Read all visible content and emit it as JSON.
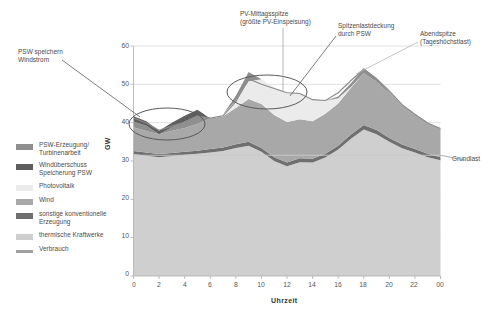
{
  "chart_data": {
    "type": "area",
    "title": "",
    "xlabel": "Uhrzeit",
    "ylabel": "GW",
    "ylim": [
      0,
      60
    ],
    "ytick_labels": [
      "0",
      "10",
      "20",
      "30",
      "40",
      "50",
      "60"
    ],
    "ytick_values": [
      0,
      10,
      20,
      30,
      40,
      50,
      60
    ],
    "xtick_labels": [
      "0",
      "2",
      "4",
      "6",
      "8",
      "10",
      "12",
      "14",
      "16",
      "18",
      "20",
      "22",
      "00"
    ],
    "xtick_values": [
      0,
      2,
      4,
      6,
      8,
      10,
      12,
      14,
      16,
      18,
      20,
      22,
      24
    ],
    "grid": true,
    "legend_position": "left-outside",
    "x": [
      0,
      1,
      2,
      3,
      4,
      5,
      6,
      7,
      8,
      9,
      10,
      11,
      12,
      13,
      14,
      15,
      16,
      17,
      18,
      19,
      20,
      21,
      22,
      23,
      24
    ],
    "series": [
      {
        "name": "thermische Kraftwerke",
        "color": "#cfcfcf",
        "values": [
          31.8,
          31.4,
          31.0,
          31.3,
          31.6,
          31.9,
          32.2,
          32.6,
          33.4,
          34.0,
          32.4,
          30.0,
          28.6,
          29.7,
          29.6,
          30.9,
          33.0,
          35.8,
          38.2,
          37.0,
          35.0,
          33.3,
          32.2,
          31.0,
          30.2
        ]
      },
      {
        "name": "sonstige konventionelle Erzeugung",
        "color": "#6f6f6f",
        "values": [
          0.8,
          0.8,
          0.8,
          0.8,
          0.8,
          0.8,
          0.9,
          0.9,
          1.0,
          1.0,
          1.0,
          1.0,
          1.0,
          1.0,
          1.0,
          1.0,
          1.0,
          1.1,
          1.2,
          1.1,
          1.0,
          1.0,
          0.9,
          0.9,
          0.8
        ]
      },
      {
        "name": "Wind",
        "color": "#a8a8a8",
        "values": [
          6.2,
          5.6,
          5.2,
          5.8,
          6.2,
          7.0,
          8.0,
          8.2,
          9.4,
          11.2,
          11.5,
          11.0,
          10.6,
          10.2,
          9.8,
          10.4,
          11.0,
          12.2,
          13.5,
          12.6,
          11.6,
          10.4,
          9.0,
          8.0,
          7.4
        ]
      },
      {
        "name": "Photovoltaik",
        "color": "#ebebeb",
        "values": [
          0.0,
          0.0,
          0.0,
          0.0,
          0.0,
          0.0,
          0.0,
          0.4,
          2.0,
          4.6,
          6.4,
          7.2,
          7.6,
          7.0,
          5.6,
          3.4,
          1.4,
          0.3,
          0.0,
          0.0,
          0.0,
          0.0,
          0.0,
          0.0,
          0.0
        ]
      },
      {
        "name": "PSW-Erzeugung/ Turbinenarbeit",
        "color": "#8f8f8f",
        "values": [
          1.5,
          1.4,
          0.0,
          0.9,
          1.7,
          2.1,
          0.0,
          0.0,
          1.2,
          2.4,
          0.0,
          0.0,
          0.0,
          0.0,
          0.0,
          0.0,
          0.4,
          0.9,
          1.3,
          0.9,
          0.4,
          0.0,
          0.0,
          0.0,
          0.0
        ]
      },
      {
        "name": "Windüberschuss Speicherung PSW",
        "color": "#5e5e5e",
        "values": [
          1.4,
          1.2,
          0.9,
          1.2,
          1.5,
          1.6,
          0.0,
          0.0,
          0.0,
          0.0,
          0.0,
          0.0,
          0.0,
          0.0,
          0.0,
          0.0,
          0.0,
          0.0,
          0.0,
          0.0,
          0.0,
          0.0,
          0.0,
          0.0,
          0.0
        ]
      },
      {
        "name": "Verbrauch",
        "color": "#b0b0b0",
        "values": [
          41.2,
          39.9,
          38.0,
          39.1,
          40.2,
          41.8,
          41.2,
          41.8,
          45.5,
          51.4,
          50.0,
          48.9,
          47.8,
          47.6,
          46.0,
          45.8,
          47.8,
          51.0,
          54.0,
          51.5,
          48.3,
          44.7,
          42.2,
          39.9,
          38.5
        ]
      }
    ],
    "reference_lines": [
      {
        "name": "Grundlast",
        "value": 31.5,
        "label": "Grundlast"
      }
    ],
    "annotations": [
      {
        "id": "psw-speichern",
        "text_lines": [
          "PSW speichern",
          "Windstrom"
        ]
      },
      {
        "id": "pv-mittagsspitze",
        "text_lines": [
          "PV-Mittagsspitze",
          "(größte PV-Einspeisung)"
        ]
      },
      {
        "id": "spitzenlastdeckung",
        "text_lines": [
          "Spitzenlastdeckung",
          "durch PSW"
        ]
      },
      {
        "id": "abendspitze",
        "text_lines": [
          "Abendspitze",
          "(Tageshöchstlast)"
        ]
      }
    ]
  },
  "legend": {
    "items": [
      {
        "label_line1": "PSW-Erzeugung/",
        "label_line2": "Turbinenarbeit",
        "color": "#8f8f8f",
        "type": "box"
      },
      {
        "label_line1": "Windüberschuss",
        "label_line2": "Speicherung PSW",
        "color": "#5e5e5e",
        "type": "box"
      },
      {
        "label_line1": "Photovoltaik",
        "label_line2": "",
        "color": "#ebebeb",
        "type": "box"
      },
      {
        "label_line1": "Wind",
        "label_line2": "",
        "color": "#a8a8a8",
        "type": "box"
      },
      {
        "label_line1": "sonstige konventionelle",
        "label_line2": "Erzeugung",
        "color": "#6f6f6f",
        "type": "box"
      },
      {
        "label_line1": "thermische Kraftwerke",
        "label_line2": "",
        "color": "#cfcfcf",
        "type": "box"
      },
      {
        "label_line1": "Verbrauch",
        "label_line2": "",
        "color": "#a0a0a0",
        "type": "line"
      }
    ]
  },
  "axes": {
    "y_title": "GW",
    "x_title": "Uhrzeit",
    "y_ticks": [
      "60",
      "50",
      "40",
      "30",
      "20",
      "10",
      "0"
    ],
    "x_ticks": [
      "0",
      "2",
      "4",
      "6",
      "8",
      "10",
      "12",
      "14",
      "16",
      "18",
      "20",
      "22",
      "00"
    ]
  },
  "annotations": {
    "psw_line1": "PSW speichern",
    "psw_line2": "Windstrom",
    "pv_line1": "PV-Mittagsspitze",
    "pv_line2": "(größte PV-Einspeisung)",
    "spitz_line1": "Spitzenlastdeckung",
    "spitz_line2": "durch PSW",
    "abend_line1": "Abendspitze",
    "abend_line2": "(Tageshöchstlast)",
    "grundlast": "Grundlast"
  },
  "colors": {
    "plot_bg": "#ffffff",
    "grid": "#d9d9d9",
    "axis": "#b5b5b5",
    "text": "#4a4a4a",
    "annotation_stroke": "#5a5a5a"
  }
}
